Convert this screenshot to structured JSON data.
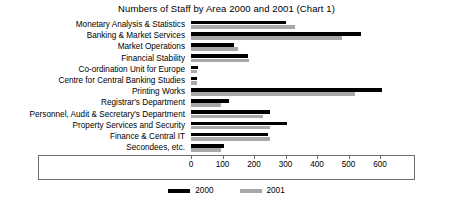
{
  "chart_data": {
    "type": "bar",
    "orientation": "horizontal",
    "title": "Numbers of Staff by Area 2000 and 2001 (Chart 1)",
    "xlabel": "",
    "ylabel": "",
    "xlim": [
      0,
      680
    ],
    "xticks": [
      0,
      100,
      200,
      300,
      400,
      500,
      600
    ],
    "xtick_labels": [
      "0",
      "100",
      "200",
      "300",
      "400",
      "500",
      "600"
    ],
    "grid": false,
    "legend_position": "bottom-center",
    "categories": [
      "Monetary Analysis & Statistics",
      "Banking & Market Services",
      "Market Operations",
      "Financial Stability",
      "Co-ordination Unit for Europe",
      "Centre for Central Banking Studies",
      "Printing Works",
      "Registrar's Department",
      "Personnel, Audit & Secretary's Department",
      "Property Services and Security",
      "Finance & Central IT",
      "Secondees, etc."
    ],
    "series": [
      {
        "name": "2000",
        "color": "#000000",
        "values": [
          300,
          540,
          135,
          180,
          22,
          20,
          605,
          120,
          250,
          305,
          245,
          105
        ]
      },
      {
        "name": "2001",
        "color": "#a8a8a8",
        "values": [
          330,
          480,
          150,
          185,
          20,
          18,
          520,
          95,
          230,
          250,
          250,
          95
        ]
      }
    ]
  },
  "legend": {
    "items": [
      {
        "label": "2000",
        "color": "#000000"
      },
      {
        "label": "2001",
        "color": "#a8a8a8"
      }
    ]
  }
}
